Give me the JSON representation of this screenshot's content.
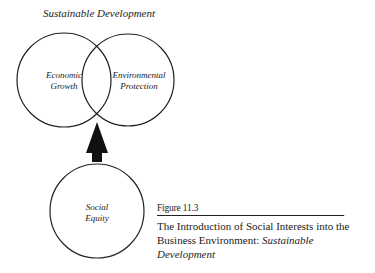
{
  "diagram": {
    "title": "Sustainable Development",
    "circles": [
      {
        "id": "economic",
        "lines": [
          "Economic",
          "Growth"
        ]
      },
      {
        "id": "environmental",
        "lines": [
          "Environmental",
          "Protection"
        ]
      },
      {
        "id": "social",
        "lines": [
          "Social",
          "Equity"
        ]
      }
    ],
    "arrow": {
      "from": "social",
      "to": "intersection-economic-environmental"
    }
  },
  "caption": {
    "figure_number": "Figure 11.3",
    "text_plain": "The Introduction of Social Interests into the Business Environment: ",
    "text_italic": "Sustainable Development"
  },
  "colors": {
    "stroke": "#222222",
    "background": "#ffffff"
  }
}
